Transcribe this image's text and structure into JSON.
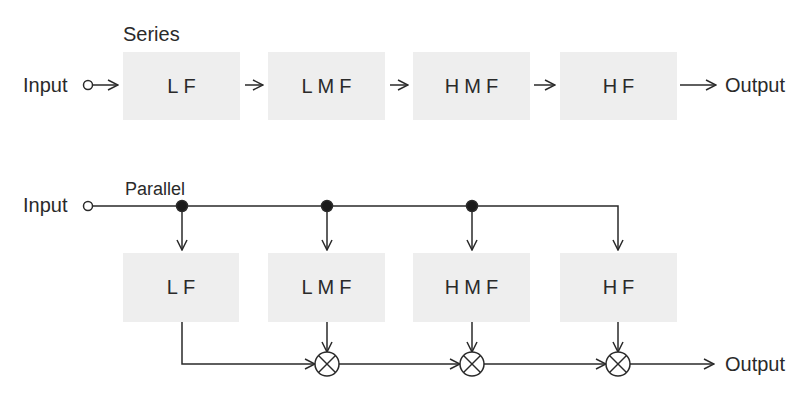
{
  "series": {
    "title": "Series",
    "input_label": "Input",
    "output_label": "Output",
    "blocks": [
      "LF",
      "LMF",
      "HMF",
      "HF"
    ]
  },
  "parallel": {
    "title": "Parallel",
    "input_label": "Input",
    "output_label": "Output",
    "blocks": [
      "LF",
      "LMF",
      "HMF",
      "HF"
    ],
    "combiner_symbol": "multiplier"
  },
  "colors": {
    "block_fill": "#eeeeee",
    "line": "#2a2a2a",
    "background": "#ffffff"
  }
}
